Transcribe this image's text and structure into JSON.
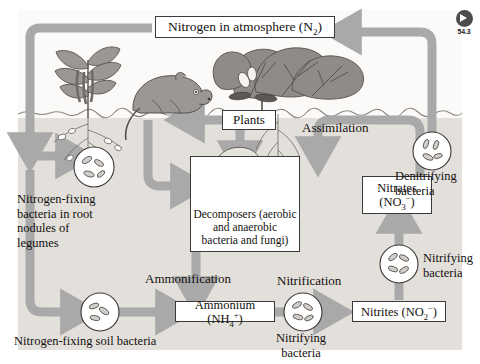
{
  "figure": {
    "title": "Nitrogen in atmosphere (N2)",
    "badge": {
      "icon": "circle-arrow-right-icon",
      "number": "54.3"
    },
    "accent_arrow": "#a9a9a9",
    "soil_color": "#e3e0db",
    "sky_color": "#fbfaf8"
  },
  "boxes": [
    {
      "id": "atmosphere",
      "name": "nitrogen-in-atmosphere-box",
      "lines": [
        {
          "text": "Nitrogen in atmosphere (N",
          "sub": "2",
          "tail": ")"
        }
      ],
      "plain": "Nitrogen in atmosphere (N2)"
    },
    {
      "id": "plants",
      "name": "plants-box",
      "plain": "Plants"
    },
    {
      "id": "decomposers",
      "name": "decomposers-box",
      "plain": "Decomposers (aerobic and anaerobic bacteria and fungi)",
      "line1": "Decomposers (aerobic",
      "line2": "and anaerobic",
      "line3": "bacteria and fungi)"
    },
    {
      "id": "ammonium",
      "name": "ammonium-box",
      "plain": "Ammonium (NH4+)",
      "pre": "Ammonium (NH",
      "sub": "4",
      "sup": "+",
      "tail": ")"
    },
    {
      "id": "nitrites",
      "name": "nitrites-box",
      "plain": "Nitrites (NO2-)",
      "pre": "Nitrites (NO",
      "sub": "2",
      "sup": "−",
      "tail": ")"
    },
    {
      "id": "nitrates",
      "name": "nitrates-box",
      "plain": "Nitrates (NO3-)",
      "line1": "Nitrates",
      "pre": "(NO",
      "sub": "3",
      "sup": "−",
      "tail": ")"
    }
  ],
  "labels": {
    "assimilation": "Assimilation",
    "ammonification": "Ammonification",
    "nitrification": "Nitrification",
    "root_nodules": "Nitrogen-fixing\nbacteria in root\nnodules of\nlegumes",
    "soil_bacteria": "Nitrogen-fixing soil bacteria",
    "denitrifying": "Denitrifying\nbacteria",
    "nitrifying_right": "Nitrifying\nbacteria",
    "nitrifying_bottom": "Nitrifying\nbacteria"
  },
  "organisms": {
    "legume_plant": "legume-plant-illustration",
    "animal": "rodent-illustration",
    "leafy_plant": "leafy-plant-illustration",
    "mushrooms": "mushroom-illustration",
    "roots_left": "root-system-illustration",
    "roots_right": "root-system-illustration"
  },
  "microbe_circles": [
    {
      "name": "microbe-circle-root-nodule"
    },
    {
      "name": "microbe-circle-soil-bacteria"
    },
    {
      "name": "microbe-circle-decomposers"
    },
    {
      "name": "microbe-circle-denitrifying"
    },
    {
      "name": "microbe-circle-nitrifying-right"
    },
    {
      "name": "microbe-circle-nitrifying-bottom"
    }
  ]
}
